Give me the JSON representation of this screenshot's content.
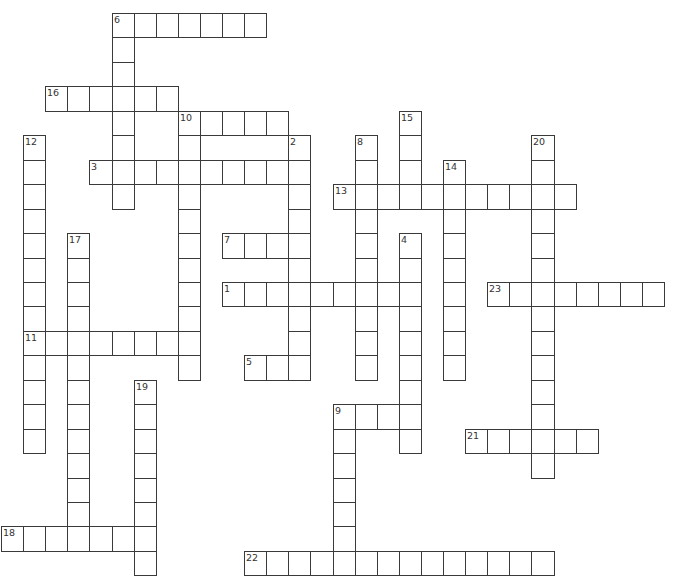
{
  "puzzle": {
    "grid": {
      "origin_x": 1,
      "origin_y": 13,
      "cell_width": 22.1,
      "cell_height": 24.45,
      "line_color": "#3a3a3a",
      "number_color": "#333333",
      "background": "#ffffff"
    },
    "entries": [
      {
        "number": "1",
        "direction": "across",
        "row": 11,
        "col": 10,
        "length": 9
      },
      {
        "number": "2",
        "direction": "down",
        "row": 5,
        "col": 13,
        "length": 10
      },
      {
        "number": "3",
        "direction": "across",
        "row": 6,
        "col": 4,
        "length": 10
      },
      {
        "number": "4",
        "direction": "down",
        "row": 9,
        "col": 18,
        "length": 9
      },
      {
        "number": "5",
        "direction": "across",
        "row": 14,
        "col": 11,
        "length": 3
      },
      {
        "number": "6",
        "direction": "across",
        "row": 0,
        "col": 5,
        "length": 7
      },
      {
        "number": "6",
        "direction": "down",
        "row": 0,
        "col": 5,
        "length": 8
      },
      {
        "number": "7",
        "direction": "across",
        "row": 9,
        "col": 10,
        "length": 4
      },
      {
        "number": "8",
        "direction": "down",
        "row": 5,
        "col": 16,
        "length": 10
      },
      {
        "number": "9",
        "direction": "across",
        "row": 16,
        "col": 15,
        "length": 4
      },
      {
        "number": "9",
        "direction": "down",
        "row": 16,
        "col": 15,
        "length": 7
      },
      {
        "number": "10",
        "direction": "across",
        "row": 4,
        "col": 8,
        "length": 5
      },
      {
        "number": "10",
        "direction": "down",
        "row": 4,
        "col": 8,
        "length": 11
      },
      {
        "number": "11",
        "direction": "across",
        "row": 13,
        "col": 1,
        "length": 8
      },
      {
        "number": "12",
        "direction": "down",
        "row": 5,
        "col": 1,
        "length": 13
      },
      {
        "number": "13",
        "direction": "across",
        "row": 7,
        "col": 15,
        "length": 11
      },
      {
        "number": "14",
        "direction": "down",
        "row": 6,
        "col": 20,
        "length": 9
      },
      {
        "number": "15",
        "direction": "down",
        "row": 4,
        "col": 18,
        "length": 4
      },
      {
        "number": "16",
        "direction": "across",
        "row": 3,
        "col": 2,
        "length": 6
      },
      {
        "number": "17",
        "direction": "down",
        "row": 9,
        "col": 3,
        "length": 13
      },
      {
        "number": "18",
        "direction": "across",
        "row": 21,
        "col": 0,
        "length": 7
      },
      {
        "number": "19",
        "direction": "down",
        "row": 15,
        "col": 6,
        "length": 8
      },
      {
        "number": "20",
        "direction": "down",
        "row": 5,
        "col": 24,
        "length": 14
      },
      {
        "number": "21",
        "direction": "across",
        "row": 17,
        "col": 21,
        "length": 6
      },
      {
        "number": "22",
        "direction": "across",
        "row": 22,
        "col": 11,
        "length": 14
      },
      {
        "number": "23",
        "direction": "across",
        "row": 11,
        "col": 22,
        "length": 8
      }
    ]
  }
}
